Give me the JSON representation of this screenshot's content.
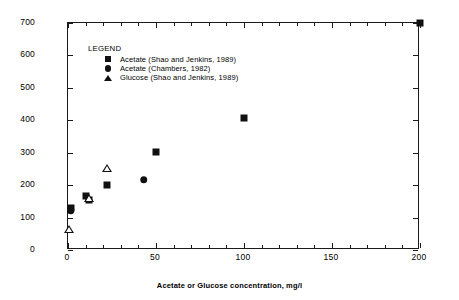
{
  "chart_data": {
    "type": "scatter",
    "title": "",
    "xlabel": "Acetate or Glucose concentration, mg/l",
    "ylabel": "SVI, ml/g",
    "xlim": [
      0,
      200
    ],
    "ylim": [
      0,
      700
    ],
    "xticks": [
      0,
      50,
      100,
      150,
      200
    ],
    "yticks": [
      0,
      100,
      200,
      300,
      400,
      500,
      600,
      700
    ],
    "x_minor_tick_interval": 10,
    "grid": false,
    "legend_title": "LEGEND",
    "legend_position": "upper-left-inside",
    "series": [
      {
        "name": "Acetate (Shao and Jenkins, 1989)",
        "marker": "square-filled",
        "points": [
          {
            "x": 1.5,
            "y": 130
          },
          {
            "x": 10,
            "y": 165
          },
          {
            "x": 12,
            "y": 155
          },
          {
            "x": 22,
            "y": 200
          },
          {
            "x": 50,
            "y": 303
          },
          {
            "x": 100,
            "y": 408
          },
          {
            "x": 200,
            "y": 700
          }
        ]
      },
      {
        "name": "Acetate (Chambers, 1982)",
        "marker": "circle-filled",
        "points": [
          {
            "x": 1.5,
            "y": 122
          },
          {
            "x": 43,
            "y": 217
          }
        ]
      },
      {
        "name": "Glucose (Shao and Jenkins, 1989)",
        "marker": "triangle-open",
        "points": [
          {
            "x": 0.5,
            "y": 65
          },
          {
            "x": 12,
            "y": 185
          },
          {
            "x": 22,
            "y": 302
          }
        ]
      }
    ]
  },
  "axes": {
    "y_tick_labels": [
      "700",
      "600",
      "500",
      "400",
      "300",
      "200",
      "100",
      "0"
    ],
    "x_tick_labels": [
      "0",
      "50",
      "100",
      "150",
      "200"
    ],
    "y_axis_title": "SVI, ml/g",
    "x_axis_title": "Acetate or Glucose concentration, mg/l"
  },
  "legend": {
    "title": "LEGEND",
    "entries": [
      {
        "marker": "square-filled-icon",
        "label": "Acetate (Shao and Jenkins, 1989)"
      },
      {
        "marker": "circle-filled-icon",
        "label": "Acetate (Chambers, 1982)"
      },
      {
        "marker": "triangle-filled-icon",
        "label": "Glucose (Shao and Jenkins, 1989)"
      }
    ]
  },
  "colors": {
    "marker": "#111111",
    "axis": "#1a1a1a",
    "background": "#ffffff"
  }
}
